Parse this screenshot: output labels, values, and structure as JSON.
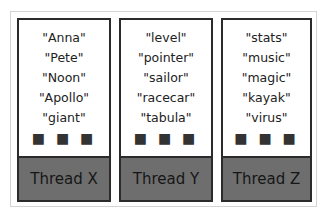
{
  "threads": [
    {
      "label": "Thread X",
      "items": [
        "\"Anna\"",
        "\"Pete\"",
        "\"Noon\"",
        "\"Apollo\"",
        "\"giant\""
      ],
      "ellipsis": "■ ■ ■"
    },
    {
      "label": "Thread Y",
      "items": [
        "\"level\"",
        "\"pointer\"",
        "\"sailor\"",
        "\"racecar\"",
        "\"tabula\""
      ],
      "ellipsis": "■ ■ ■"
    },
    {
      "label": "Thread Z",
      "items": [
        "\"stats\"",
        "\"music\"",
        "\"magic\"",
        "\"kayak\"",
        "\"virus\""
      ],
      "ellipsis": "■ ■ ■"
    }
  ],
  "colors": {
    "thread_fill": "#6e6e6e",
    "border": "#2b2b2b"
  }
}
